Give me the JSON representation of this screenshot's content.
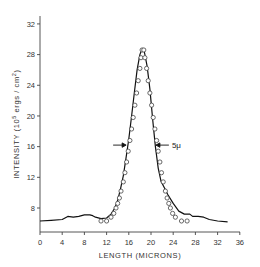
{
  "chart_data": {
    "type": "line",
    "title": "",
    "xlabel": "LENGTH (MICRONS)",
    "ylabel": "INTENSITY (10^5 ergs / cm^2)",
    "ylabel_parts": {
      "prefix": "INTENSITY (10",
      "sup1": "5",
      "mid": " ergs / cm",
      "sup2": "2",
      "suffix": ")"
    },
    "xlim": [
      0,
      36
    ],
    "ylim": [
      5,
      32
    ],
    "x_ticks": [
      0,
      4,
      8,
      12,
      16,
      20,
      24,
      28,
      32,
      36
    ],
    "y_ticks": [
      8,
      12,
      16,
      20,
      24,
      28,
      32
    ],
    "grid": false,
    "legend": null,
    "annotations": [
      {
        "text": "5μ",
        "x": 22.2,
        "y": 16.2,
        "note": "full width at half maximum marked by arrows"
      }
    ],
    "fwhm_arrows": {
      "y": 16.2,
      "left_x": 15.7,
      "right_x": 20.7
    },
    "series": [
      {
        "name": "measured (solid line)",
        "style": "line",
        "points": [
          [
            0,
            6.3
          ],
          [
            2,
            6.4
          ],
          [
            4,
            6.5
          ],
          [
            5,
            6.9
          ],
          [
            6,
            6.8
          ],
          [
            7,
            6.9
          ],
          [
            8,
            7.1
          ],
          [
            9,
            7.1
          ],
          [
            9.5,
            7.0
          ],
          [
            10,
            6.8
          ],
          [
            11,
            6.6
          ],
          [
            12,
            6.7
          ],
          [
            12.8,
            7.2
          ],
          [
            13.5,
            8.0
          ],
          [
            14,
            9.0
          ],
          [
            14.5,
            10.5
          ],
          [
            15,
            12.2
          ],
          [
            15.5,
            14.5
          ],
          [
            16,
            17.0
          ],
          [
            16.5,
            20.0
          ],
          [
            17,
            23.0
          ],
          [
            17.5,
            26.0
          ],
          [
            18,
            28.0
          ],
          [
            18.4,
            28.8
          ],
          [
            18.8,
            28.4
          ],
          [
            19.3,
            26.5
          ],
          [
            19.8,
            23.5
          ],
          [
            20.3,
            19.5
          ],
          [
            20.8,
            16.0
          ],
          [
            21.3,
            13.2
          ],
          [
            21.8,
            11.5
          ],
          [
            22.5,
            10.5
          ],
          [
            23,
            9.8
          ],
          [
            24,
            8.6
          ],
          [
            25,
            7.6
          ],
          [
            26,
            7.2
          ],
          [
            27,
            7.2
          ],
          [
            27.5,
            6.9
          ],
          [
            28.5,
            6.9
          ],
          [
            29.5,
            6.8
          ],
          [
            30.5,
            6.5
          ],
          [
            32,
            6.3
          ],
          [
            33.8,
            6.2
          ]
        ]
      },
      {
        "name": "computed (open circles)",
        "style": "markers",
        "points": [
          [
            11,
            6.3
          ],
          [
            12,
            6.3
          ],
          [
            12.8,
            6.8
          ],
          [
            13.3,
            7.3
          ],
          [
            13.7,
            8.0
          ],
          [
            14.0,
            8.6
          ],
          [
            14.3,
            9.3
          ],
          [
            14.6,
            10.2
          ],
          [
            15.0,
            11.4
          ],
          [
            15.3,
            12.6
          ],
          [
            15.6,
            14.0
          ],
          [
            15.9,
            15.4
          ],
          [
            16.2,
            16.8
          ],
          [
            16.5,
            18.3
          ],
          [
            16.8,
            19.8
          ],
          [
            17.1,
            21.4
          ],
          [
            17.4,
            23.0
          ],
          [
            17.7,
            24.6
          ],
          [
            18.0,
            26.2
          ],
          [
            18.2,
            27.6
          ],
          [
            18.4,
            28.6
          ],
          [
            18.7,
            28.6
          ],
          [
            18.9,
            27.6
          ],
          [
            19.2,
            26.2
          ],
          [
            19.5,
            24.6
          ],
          [
            19.8,
            23.0
          ],
          [
            20.1,
            21.4
          ],
          [
            20.4,
            19.8
          ],
          [
            20.7,
            18.3
          ],
          [
            21.0,
            16.8
          ],
          [
            21.3,
            15.4
          ],
          [
            21.6,
            14.0
          ],
          [
            21.9,
            12.6
          ],
          [
            22.2,
            11.4
          ],
          [
            22.6,
            10.2
          ],
          [
            22.9,
            9.3
          ],
          [
            23.2,
            8.6
          ],
          [
            23.5,
            8.0
          ],
          [
            23.9,
            7.3
          ],
          [
            24.4,
            6.8
          ],
          [
            25.5,
            6.3
          ],
          [
            26.5,
            6.3
          ]
        ]
      }
    ]
  }
}
